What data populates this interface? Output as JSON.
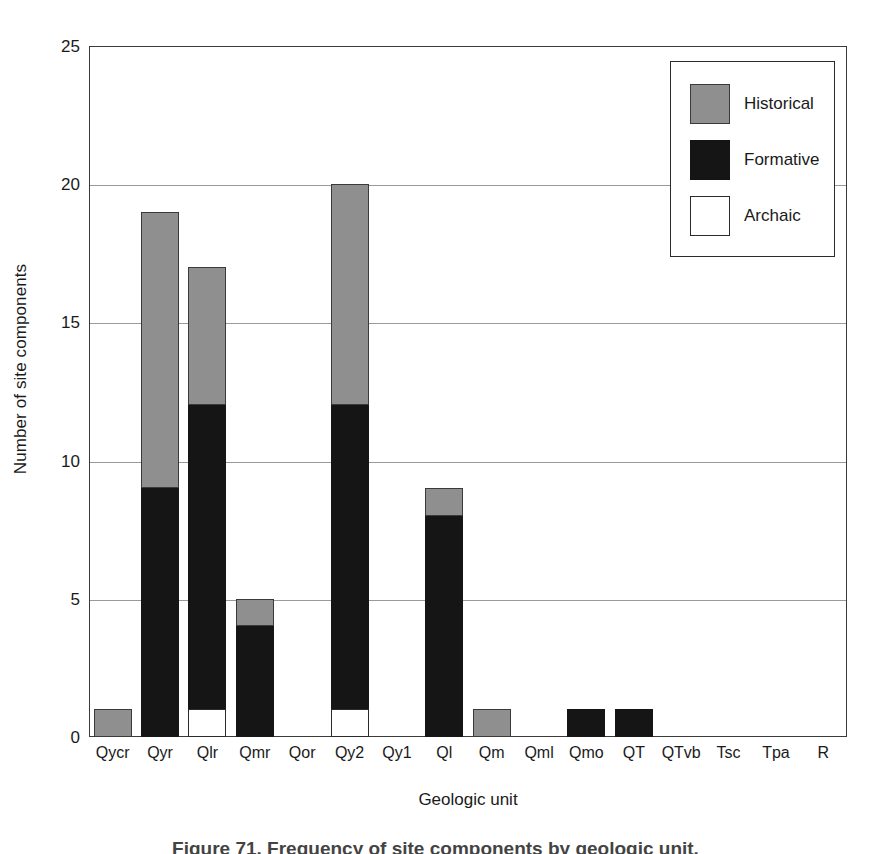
{
  "chart_data": {
    "type": "bar",
    "subtype": "stacked-bar",
    "title": "",
    "xlabel": "Geologic unit",
    "ylabel": "Number of site components",
    "ylim": [
      0,
      25
    ],
    "yticks": [
      0,
      5,
      10,
      15,
      20,
      25
    ],
    "grid": true,
    "legend_position": "top-right",
    "categories": [
      "Qycr",
      "Qyr",
      "Qlr",
      "Qmr",
      "Qor",
      "Qy2",
      "Qy1",
      "Ql",
      "Qm",
      "Qml",
      "Qmo",
      "QT",
      "QTvb",
      "Tsc",
      "Tpa",
      "R"
    ],
    "series": [
      {
        "name": "Archaic",
        "color": "#ffffff",
        "values": [
          0,
          0,
          1,
          0,
          0,
          1,
          0,
          0,
          0,
          0,
          0,
          0,
          0,
          0,
          0,
          0
        ]
      },
      {
        "name": "Formative",
        "color": "#151515",
        "values": [
          0,
          9,
          11,
          4,
          0,
          11,
          0,
          8,
          0,
          0,
          1,
          1,
          0,
          0,
          0,
          0
        ]
      },
      {
        "name": "Historical",
        "color": "#8f8f8f",
        "values": [
          1,
          10,
          5,
          1,
          0,
          8,
          0,
          1,
          1,
          0,
          0,
          0,
          0,
          0,
          0,
          0
        ]
      }
    ],
    "totals": [
      1,
      19,
      17,
      5,
      0,
      20,
      0,
      9,
      1,
      0,
      1,
      1,
      0,
      0,
      0,
      0
    ]
  },
  "axes": {
    "y_title": "Number of site components",
    "x_title": "Geologic unit",
    "y_tick_labels": [
      "0",
      "5",
      "10",
      "15",
      "20",
      "25"
    ],
    "x_tick_labels": [
      "Qycr",
      "Qyr",
      "Qlr",
      "Qmr",
      "Qor",
      "Qy2",
      "Qy1",
      "Ql",
      "Qm",
      "Qml",
      "Qmo",
      "QT",
      "QTvb",
      "Tsc",
      "Tpa",
      "R"
    ]
  },
  "legend": {
    "entries": [
      {
        "label": "Historical",
        "swatch": "historical"
      },
      {
        "label": "Formative",
        "swatch": "formative"
      },
      {
        "label": "Archaic",
        "swatch": "archaic"
      }
    ]
  },
  "caption": {
    "text": "Figure 71. Frequency of site components by geologic unit."
  },
  "colors": {
    "historical": "#8f8f8f",
    "formative": "#151515",
    "archaic": "#ffffff",
    "axis": "#3a3a3a",
    "grid": "#9a9a9a"
  }
}
